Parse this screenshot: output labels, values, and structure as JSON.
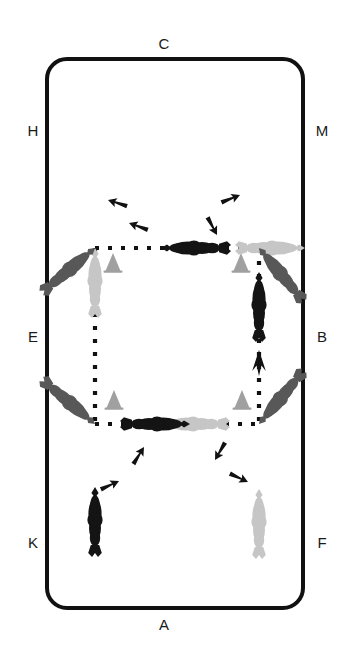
{
  "diagram": {
    "type": "dressage-arena-figure",
    "arena": {
      "shape": "rounded-rectangle",
      "x": 47,
      "y": 59,
      "width": 256,
      "height": 549,
      "corner_radius": 20,
      "stroke_color": "#111111",
      "stroke_width": 4,
      "fill_color": "#ffffff"
    },
    "letters": [
      {
        "id": "letter-c",
        "label": "C",
        "x": 164,
        "y": 36,
        "position": "top-center"
      },
      {
        "id": "letter-h",
        "label": "H",
        "x": 21,
        "y": 123,
        "position": "left-upper"
      },
      {
        "id": "letter-m",
        "label": "M",
        "x": 313,
        "y": 123,
        "position": "right-upper"
      },
      {
        "id": "letter-e",
        "label": "E",
        "x": 21,
        "y": 329,
        "position": "left-middle"
      },
      {
        "id": "letter-b",
        "label": "B",
        "x": 313,
        "y": 329,
        "position": "right-middle"
      },
      {
        "id": "letter-k",
        "label": "K",
        "x": 21,
        "y": 535,
        "position": "left-lower"
      },
      {
        "id": "letter-f",
        "label": "F",
        "x": 313,
        "y": 535,
        "position": "right-lower"
      },
      {
        "id": "letter-a",
        "label": "A",
        "x": 164,
        "y": 617,
        "position": "bottom-center"
      }
    ],
    "path": {
      "description": "Dotted square track travelled clockwise between four corner points",
      "color": "#111111",
      "style": "dotted",
      "dot_size": 4,
      "dot_gap": 9,
      "corners": {
        "top_left": {
          "x": 95,
          "y": 248
        },
        "top_right": {
          "x": 259,
          "y": 248
        },
        "bottom_left": {
          "x": 95,
          "y": 424
        },
        "bottom_right": {
          "x": 259,
          "y": 424
        }
      },
      "segments": [
        {
          "id": "segment-top",
          "from": "top_left",
          "to": "top_right",
          "direction": "rightward"
        },
        {
          "id": "segment-left",
          "from": "top_left",
          "to": "bottom_left",
          "direction": "downward"
        },
        {
          "id": "segment-bottom",
          "from": "bottom_left",
          "to": "bottom_right",
          "direction": "rightward"
        },
        {
          "id": "segment-right",
          "from": "bottom_right",
          "to": "top_right",
          "direction": "upward"
        }
      ],
      "direction_arrows": [
        {
          "id": "arrow-left-down",
          "x": 95,
          "y": 298,
          "heading": "down"
        },
        {
          "id": "arrow-right-up",
          "x": 259,
          "y": 352,
          "heading": "up"
        }
      ]
    },
    "cones": [
      {
        "id": "cone-top-left",
        "x": 113,
        "y": 268,
        "color": "#a0a0a0"
      },
      {
        "id": "cone-top-right",
        "x": 241,
        "y": 268,
        "color": "#a0a0a0"
      },
      {
        "id": "cone-bottom-left",
        "x": 114,
        "y": 405,
        "color": "#a0a0a0"
      },
      {
        "id": "cone-bottom-right",
        "x": 242,
        "y": 405,
        "color": "#a0a0a0"
      }
    ],
    "shades": {
      "dark": "#141414",
      "medium": "#585858",
      "light": "#c6c6c6"
    },
    "corner_groups": [
      {
        "id": "group-top-left",
        "pivot_x": 95,
        "pivot_y": 248,
        "label": "Top-left turn: arrival from the left rein, quarter-pirouette to the right",
        "horses": [
          {
            "id": "tl-horse-light",
            "shade": "light",
            "heading": "up",
            "order": "start"
          },
          {
            "id": "tl-horse-medium",
            "shade": "medium",
            "heading": "up-right",
            "order": "middle"
          },
          {
            "id": "tl-horse-dark",
            "shade": "dark",
            "heading": "right",
            "order": "finish"
          }
        ],
        "arrows": [
          {
            "id": "tl-arrow-1",
            "from_shade": "medium",
            "to_shade": "light"
          },
          {
            "id": "tl-arrow-2",
            "from_shade": "dark",
            "to_shade": "medium"
          }
        ]
      },
      {
        "id": "group-top-right",
        "pivot_x": 259,
        "pivot_y": 248,
        "label": "Top-right turn: arrival along the top line, quarter-pirouette to the right",
        "horses": [
          {
            "id": "tr-horse-light",
            "shade": "light",
            "heading": "right",
            "order": "start"
          },
          {
            "id": "tr-horse-medium",
            "shade": "medium",
            "heading": "up-left",
            "order": "middle"
          },
          {
            "id": "tr-horse-dark",
            "shade": "dark",
            "heading": "up",
            "order": "finish"
          }
        ],
        "arrows": [
          {
            "id": "tr-arrow-1",
            "from_shade": "medium",
            "to_shade": "dark"
          },
          {
            "id": "tr-arrow-2",
            "from_shade": "light",
            "to_shade": "medium"
          }
        ]
      },
      {
        "id": "group-bottom-left",
        "pivot_x": 95,
        "pivot_y": 424,
        "label": "Bottom-left turn: arrival down the left line, quarter-pirouette to the right",
        "horses": [
          {
            "id": "bl-horse-dark",
            "shade": "dark",
            "heading": "down",
            "order": "start"
          },
          {
            "id": "bl-horse-medium",
            "shade": "medium",
            "heading": "down-right",
            "order": "middle"
          },
          {
            "id": "bl-horse-light",
            "shade": "light",
            "heading": "right",
            "order": "finish"
          }
        ],
        "arrows": [
          {
            "id": "bl-arrow-1",
            "from_shade": "medium",
            "to_shade": "light"
          },
          {
            "id": "bl-arrow-2",
            "from_shade": "dark",
            "to_shade": "medium"
          }
        ]
      },
      {
        "id": "group-bottom-right",
        "pivot_x": 259,
        "pivot_y": 424,
        "label": "Bottom-right turn: arrival along the bottom line, quarter-pirouette to the right",
        "horses": [
          {
            "id": "br-horse-light",
            "shade": "light",
            "heading": "down",
            "order": "start"
          },
          {
            "id": "br-horse-medium",
            "shade": "medium",
            "heading": "down-left",
            "order": "middle"
          },
          {
            "id": "br-horse-dark",
            "shade": "dark",
            "heading": "left",
            "order": "finish"
          }
        ],
        "arrows": [
          {
            "id": "br-arrow-1",
            "from_shade": "dark",
            "to_shade": "medium"
          },
          {
            "id": "br-arrow-2",
            "from_shade": "medium",
            "to_shade": "light"
          }
        ]
      }
    ]
  }
}
